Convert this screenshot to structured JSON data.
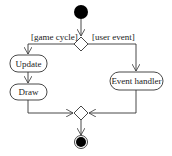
{
  "diagram": {
    "type": "uml-activity",
    "nodes": {
      "start": {
        "kind": "initial"
      },
      "decision": {
        "kind": "decision"
      },
      "update": {
        "kind": "action",
        "label": "Update"
      },
      "draw": {
        "kind": "action",
        "label": "Draw"
      },
      "event_handler": {
        "kind": "action",
        "label": "Event handler"
      },
      "merge": {
        "kind": "merge"
      },
      "end": {
        "kind": "final"
      }
    },
    "guards": {
      "left": "[game cycle]",
      "right": "[user event]"
    },
    "edges": [
      {
        "from": "start",
        "to": "decision"
      },
      {
        "from": "decision",
        "to": "update",
        "guard": "[game cycle]"
      },
      {
        "from": "update",
        "to": "draw"
      },
      {
        "from": "decision",
        "to": "event_handler",
        "guard": "[user event]"
      },
      {
        "from": "draw",
        "to": "merge"
      },
      {
        "from": "event_handler",
        "to": "merge"
      },
      {
        "from": "merge",
        "to": "end"
      }
    ],
    "colors": {
      "line": "#333333",
      "fill": "#ffffff",
      "node_fill": "#000000"
    }
  }
}
